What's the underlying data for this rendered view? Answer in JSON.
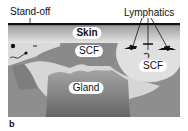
{
  "figure": {
    "panel_letter": "b",
    "labels": {
      "standoff": "Stand-off",
      "lymphatics": "Lymphatics",
      "skin": "Skin",
      "scf_left": "SCF",
      "scf_right": "SCF",
      "gland": "Gland"
    },
    "colors": {
      "standoff_line": "#111111",
      "skin_top": "#9a9a9a",
      "skin_bottom": "#e2e2e2",
      "scf_dark": "#8a8a8a",
      "scf_light": "#dcdcdc",
      "gland_top": "#9c9c9c",
      "gland_bottom": "#6a6a6a",
      "deep_tissue": "#8c8c8c"
    }
  }
}
